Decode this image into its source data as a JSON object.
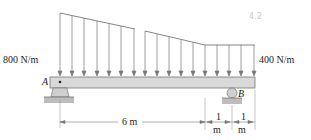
{
  "diagram": {
    "type": "beam-distributed-load",
    "load_left": "800 N/m",
    "load_right": "400 N/m",
    "support_a": "A",
    "support_b": "B",
    "dim_main": "6 m",
    "dim_seg1_num": "1",
    "dim_seg1_unit": "m",
    "dim_seg2_num": "1",
    "dim_seg2_unit": "m",
    "handwritten_note": "4.2",
    "colors": {
      "beam": "#d9d9d9",
      "line": "#555555",
      "text": "#222222"
    }
  }
}
